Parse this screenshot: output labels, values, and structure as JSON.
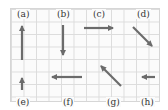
{
  "figure": {
    "arrow_color": "#6b6b6b",
    "grid_color": "#dcdcdc",
    "vectors": [
      {
        "label": "(a)",
        "direction": "up",
        "x1": 22,
        "y1": 60,
        "x2": 22,
        "y2": 26,
        "lx": 16,
        "ly": 9
      },
      {
        "label": "(b)",
        "direction": "down",
        "x1": 63,
        "y1": 25,
        "x2": 63,
        "y2": 55,
        "lx": 56,
        "ly": 9
      },
      {
        "label": "(c)",
        "direction": "right",
        "x1": 84,
        "y1": 28,
        "x2": 113,
        "y2": 28,
        "lx": 92,
        "ly": 9
      },
      {
        "label": "(d)",
        "direction": "down-right",
        "x1": 133,
        "y1": 27,
        "x2": 152,
        "y2": 46,
        "lx": 136,
        "ly": 9
      },
      {
        "label": "(e)",
        "direction": "up",
        "x1": 22,
        "y1": 90,
        "x2": 22,
        "y2": 78,
        "lx": 16,
        "ly": 97
      },
      {
        "label": "(f)",
        "direction": "left",
        "x1": 82,
        "y1": 77,
        "x2": 52,
        "y2": 77,
        "lx": 62,
        "ly": 97
      },
      {
        "label": "(g)",
        "direction": "up-left",
        "x1": 121,
        "y1": 86,
        "x2": 101,
        "y2": 66,
        "lx": 106,
        "ly": 97
      },
      {
        "label": "(h)",
        "direction": "left",
        "x1": 155,
        "y1": 77,
        "x2": 142,
        "y2": 77,
        "lx": 140,
        "ly": 97
      }
    ]
  }
}
